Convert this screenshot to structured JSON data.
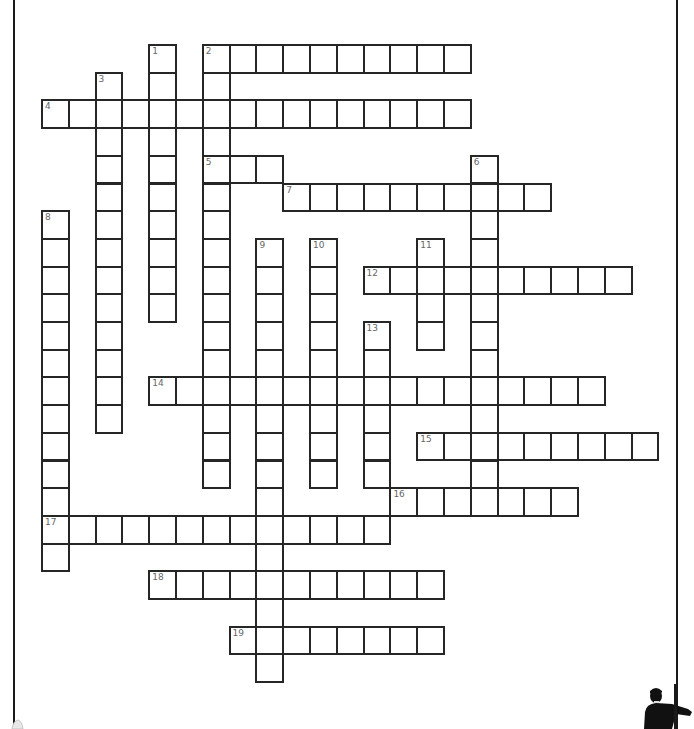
{
  "puzzle": {
    "grid_origin": {
      "x": 42,
      "y": 45
    },
    "cell_size": {
      "w": 26.8,
      "h": 27.7
    },
    "words": [
      {
        "number": 1,
        "direction": "down",
        "col": 4,
        "row": 0,
        "length": 10
      },
      {
        "number": 2,
        "direction": "across",
        "col": 6,
        "row": 0,
        "length": 10
      },
      {
        "number": 2,
        "direction": "down",
        "col": 6,
        "row": 0,
        "length": 16
      },
      {
        "number": 3,
        "direction": "down",
        "col": 2,
        "row": 1,
        "length": 13
      },
      {
        "number": 4,
        "direction": "across",
        "col": 0,
        "row": 2,
        "length": 16
      },
      {
        "number": 5,
        "direction": "across",
        "col": 6,
        "row": 4,
        "length": 3
      },
      {
        "number": 6,
        "direction": "down",
        "col": 16,
        "row": 4,
        "length": 13
      },
      {
        "number": 7,
        "direction": "across",
        "col": 9,
        "row": 5,
        "length": 10
      },
      {
        "number": 8,
        "direction": "down",
        "col": 0,
        "row": 6,
        "length": 13
      },
      {
        "number": 9,
        "direction": "down",
        "col": 8,
        "row": 7,
        "length": 16
      },
      {
        "number": 10,
        "direction": "down",
        "col": 10,
        "row": 7,
        "length": 9
      },
      {
        "number": 11,
        "direction": "down",
        "col": 14,
        "row": 7,
        "length": 4
      },
      {
        "number": 12,
        "direction": "across",
        "col": 12,
        "row": 8,
        "length": 10
      },
      {
        "number": 13,
        "direction": "down",
        "col": 12,
        "row": 10,
        "length": 6
      },
      {
        "number": 14,
        "direction": "across",
        "col": 4,
        "row": 12,
        "length": 17
      },
      {
        "number": 15,
        "direction": "across",
        "col": 14,
        "row": 14,
        "length": 9
      },
      {
        "number": 16,
        "direction": "across",
        "col": 13,
        "row": 16,
        "length": 7
      },
      {
        "number": 17,
        "direction": "across",
        "col": 0,
        "row": 17,
        "length": 13
      },
      {
        "number": 18,
        "direction": "across",
        "col": 4,
        "row": 19,
        "length": 11
      },
      {
        "number": 19,
        "direction": "across",
        "col": 7,
        "row": 21,
        "length": 8
      }
    ]
  },
  "decorations": {
    "figure_icon": "person-silhouette-icon",
    "colors": {
      "line": "#262626",
      "number": "#666666",
      "background": "#ffffff"
    }
  }
}
